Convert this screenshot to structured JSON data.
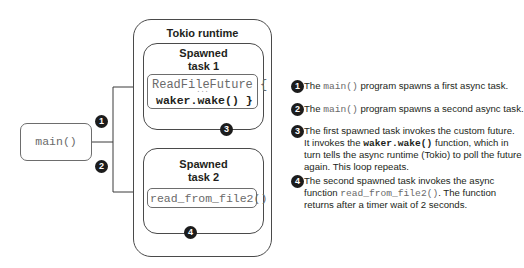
{
  "diagram": {
    "runtime_title": "Tokio runtime",
    "task1": {
      "title_line1": "Spawned",
      "title_line2": "task 1",
      "code_line1": "ReadFileFuture {",
      "code_ellipsis": "...",
      "code_line2": "waker.wake() }"
    },
    "task2": {
      "title_line1": "Spawned",
      "title_line2": "task 2",
      "code_line1": "read_from_file2()"
    },
    "main_label": "main()",
    "badges": [
      "1",
      "2",
      "3",
      "4"
    ]
  },
  "legend": {
    "items": [
      {
        "badge": "1",
        "lines": [
          {
            "pre": "The ",
            "code": "main()",
            "post": " program spawns a first async task."
          }
        ]
      },
      {
        "badge": "2",
        "lines": [
          {
            "pre": "The ",
            "code": "main()",
            "post": " program spawns a second async task."
          }
        ]
      },
      {
        "badge": "3",
        "lines": [
          {
            "pre": "The first spawned task invokes the custom future.",
            "code": "",
            "post": ""
          },
          {
            "pre": "It invokes the ",
            "code": "waker.wake()",
            "post": " function, which in"
          },
          {
            "pre": "turn tells the async runtime (Tokio) to poll the future",
            "code": "",
            "post": ""
          },
          {
            "pre": "again. This loop repeats.",
            "code": "",
            "post": ""
          }
        ]
      },
      {
        "badge": "4",
        "lines": [
          {
            "pre": "The second spawned task invokes the async",
            "code": "",
            "post": ""
          },
          {
            "pre": "function ",
            "code": "read_from_file2()",
            "post": ". The function"
          },
          {
            "pre": "returns after a timer wait of 2 seconds.",
            "code": "",
            "post": ""
          }
        ]
      }
    ]
  },
  "colors": {
    "badge": "#1c1c1c",
    "line": "#3a3a3a",
    "code_text": "#6a6a6a"
  }
}
